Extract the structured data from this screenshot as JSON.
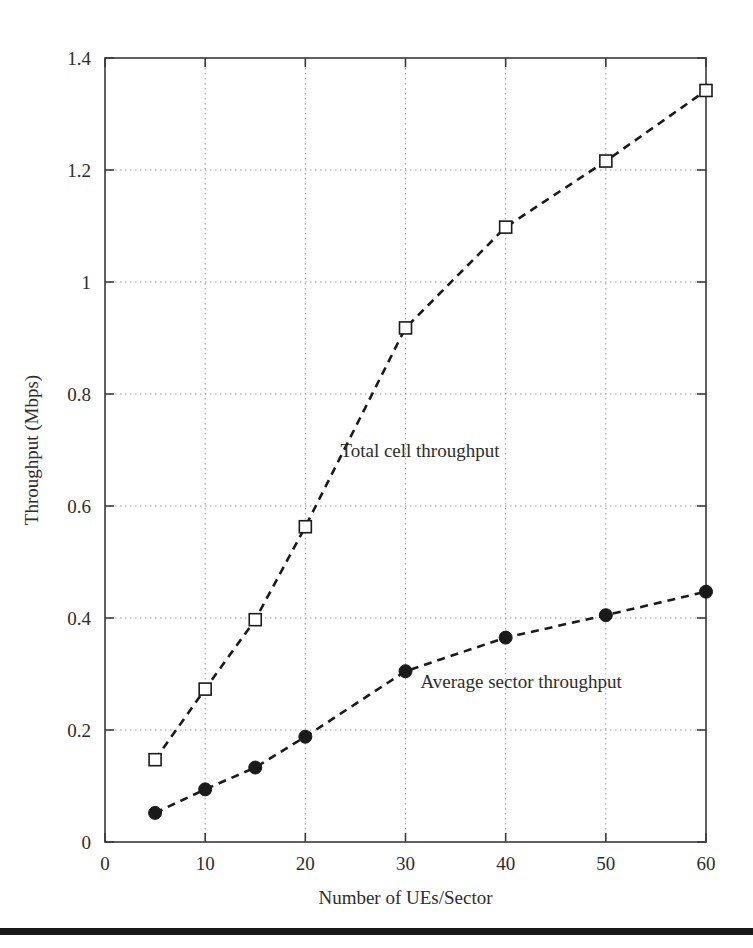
{
  "chart_data": {
    "type": "line",
    "title": "",
    "xlabel": "Number of UEs/Sector",
    "ylabel": "Throughput (Mbps)",
    "xlim": [
      0,
      60
    ],
    "ylim": [
      0,
      1.4
    ],
    "xticks": [
      0,
      10,
      20,
      30,
      40,
      50,
      60
    ],
    "xtick_labels": [
      "0",
      "10",
      "20",
      "30",
      "40",
      "50",
      "60"
    ],
    "yticks": [
      0,
      0.2,
      0.4,
      0.6,
      0.8,
      1,
      1.2,
      1.4
    ],
    "ytick_labels": [
      "0",
      "0.2",
      "0.4",
      "0.6",
      "0.8",
      "1",
      "1.2",
      "1.4"
    ],
    "grid": true,
    "grid_style": "dotted",
    "legend": "annotations",
    "x": [
      5,
      10,
      15,
      20,
      30,
      40,
      50,
      60
    ],
    "series": [
      {
        "name": "Total cell throughput",
        "marker": "open-square",
        "linestyle": "dashed",
        "color": "#1a1a1a",
        "values": [
          0.147,
          0.273,
          0.397,
          0.563,
          0.918,
          1.098,
          1.216,
          1.342
        ],
        "annotation": "Total cell throughput",
        "annotation_x": 23.5,
        "annotation_y": 0.688
      },
      {
        "name": "Average sector throughput",
        "marker": "filled-circle",
        "linestyle": "dashed",
        "color": "#1a1a1a",
        "values": [
          0.052,
          0.094,
          0.133,
          0.188,
          0.305,
          0.365,
          0.405,
          0.447
        ],
        "annotation": "Average sector throughput",
        "annotation_x": 31.5,
        "annotation_y": 0.275
      }
    ]
  },
  "figure": {
    "background_color": "#ffffff",
    "axis_color": "#3a3a3a",
    "grid_color": "#9a9a9a",
    "footer_rule_color": "#1a1a1a"
  }
}
